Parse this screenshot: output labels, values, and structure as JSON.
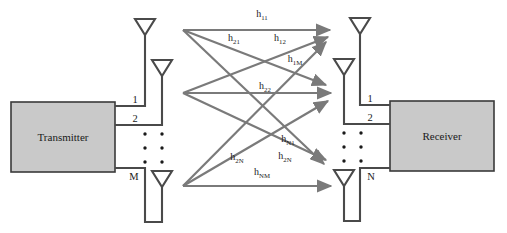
{
  "diagram": {
    "colors": {
      "block_fill": "#c9c9c9",
      "block_stroke": "#3a3a3a",
      "antenna_stroke": "#4a4a4a",
      "arrow_stroke": "#7a7a7a",
      "text": "#1a1a1a",
      "background": "#ffffff"
    },
    "transmitter": {
      "label": "Transmitter",
      "ports": [
        "1",
        "2",
        "M"
      ],
      "ellipsis": "vertical-dots"
    },
    "receiver": {
      "label": "Receiver",
      "ports": [
        "1",
        "2",
        "N"
      ],
      "ellipsis": "vertical-dots"
    },
    "channel_gains": [
      {
        "id": "h11",
        "base": "h",
        "sub": "11",
        "x": 262,
        "y": 17
      },
      {
        "id": "h21",
        "base": "h",
        "sub": "21",
        "x": 234,
        "y": 41
      },
      {
        "id": "h12",
        "base": "h",
        "sub": "12",
        "x": 280,
        "y": 41
      },
      {
        "id": "h1M",
        "base": "h",
        "sub": "1M",
        "x": 295,
        "y": 62
      },
      {
        "id": "h22",
        "base": "h",
        "sub": "22",
        "x": 265,
        "y": 89
      },
      {
        "id": "hN1",
        "base": "h",
        "sub": "N1",
        "x": 288,
        "y": 142
      },
      {
        "id": "h2N_left",
        "base": "h",
        "sub": "2N",
        "x": 237,
        "y": 160
      },
      {
        "id": "h2N_right",
        "base": "h",
        "sub": "2N",
        "x": 285,
        "y": 159
      },
      {
        "id": "hNM",
        "base": "h",
        "sub": "NM",
        "x": 262,
        "y": 175
      }
    ]
  }
}
